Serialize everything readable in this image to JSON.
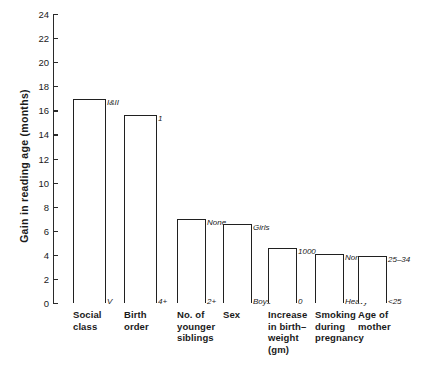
{
  "chart_data": {
    "type": "bar",
    "title": "",
    "xlabel": "",
    "ylabel": "Gain in reading age (months)",
    "ylim": [
      0,
      24
    ],
    "ytick_step": 2,
    "yticks": [
      0,
      2,
      4,
      6,
      8,
      10,
      12,
      14,
      16,
      18,
      20,
      22,
      24
    ],
    "grid": false,
    "legend": "none",
    "categories": [
      "Social class",
      "Birth order",
      "No. of younger siblings",
      "Sex",
      "Increase in birth-weight (gm)",
      "Smoking during pregnancy",
      "Age of mother"
    ],
    "values": [
      16.9,
      15.6,
      7.0,
      6.6,
      4.6,
      4.1,
      3.9
    ],
    "top_labels": [
      "I&II",
      "1",
      "None",
      "Girls",
      "1000",
      "None",
      "25–34"
    ],
    "bottom_labels": [
      "V",
      "4+",
      "2+",
      "Boys",
      "0",
      "Heavy",
      "<25"
    ],
    "category_lines": [
      [
        "Social",
        "class"
      ],
      [
        "Birth",
        "order"
      ],
      [
        "No. of",
        "younger",
        "siblings"
      ],
      [
        "Sex"
      ],
      [
        "Increase",
        "in birth–",
        "weight",
        "(gm)"
      ],
      [
        "Smoking",
        "during",
        "pregnancy"
      ],
      [
        "Age of",
        "mother"
      ]
    ],
    "bar_color": "#ffffff",
    "bar_edge_color": "#202020",
    "axis_color": "#2a2a2a"
  }
}
